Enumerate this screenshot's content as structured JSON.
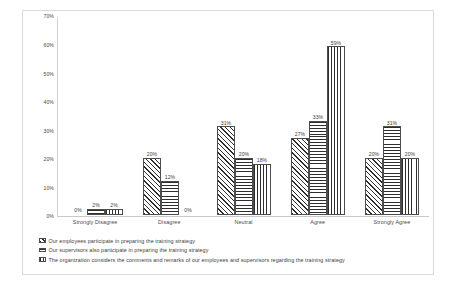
{
  "chart_data": {
    "type": "bar",
    "title": "",
    "subtitle": "",
    "xlabel": "",
    "ylabel": "",
    "ylim": [
      0,
      70
    ],
    "y_ticks": [
      "0%",
      "10%",
      "20%",
      "30%",
      "40%",
      "50%",
      "60%",
      "70%"
    ],
    "y_tick_values": [
      0,
      10,
      20,
      30,
      40,
      50,
      60,
      70
    ],
    "grid": false,
    "legend_position": "bottom",
    "categories": [
      "Strongly Disagree",
      "Disagree",
      "Neutral",
      "Agree",
      "Strongly Agree"
    ],
    "series": [
      {
        "name": "Our employees  participate in preparing the training strategy",
        "pattern": "diagonal-hatch",
        "values": [
          0,
          20,
          31,
          27,
          20
        ],
        "labels": [
          "0%",
          "20%",
          "31%",
          "27%",
          "20%"
        ]
      },
      {
        "name": "Our supervisors also participate in preparing the training strategy",
        "pattern": "horizontal-lines",
        "values": [
          2,
          12,
          20,
          33,
          31
        ],
        "labels": [
          "2%",
          "12%",
          "20%",
          "33%",
          "31%"
        ]
      },
      {
        "name": "The organization considers the comments and remarks of our employees and supervisors regarding the training strategy",
        "pattern": "vertical-lines",
        "values": [
          2,
          0,
          18,
          59,
          20
        ],
        "labels": [
          "2%",
          "0%",
          "18%",
          "59%",
          "20%"
        ]
      }
    ]
  },
  "colors": {
    "ink": "#2e2e2e",
    "axis": "#c9c9c9",
    "frame": "#d9d9d9",
    "background": "#ffffff"
  }
}
